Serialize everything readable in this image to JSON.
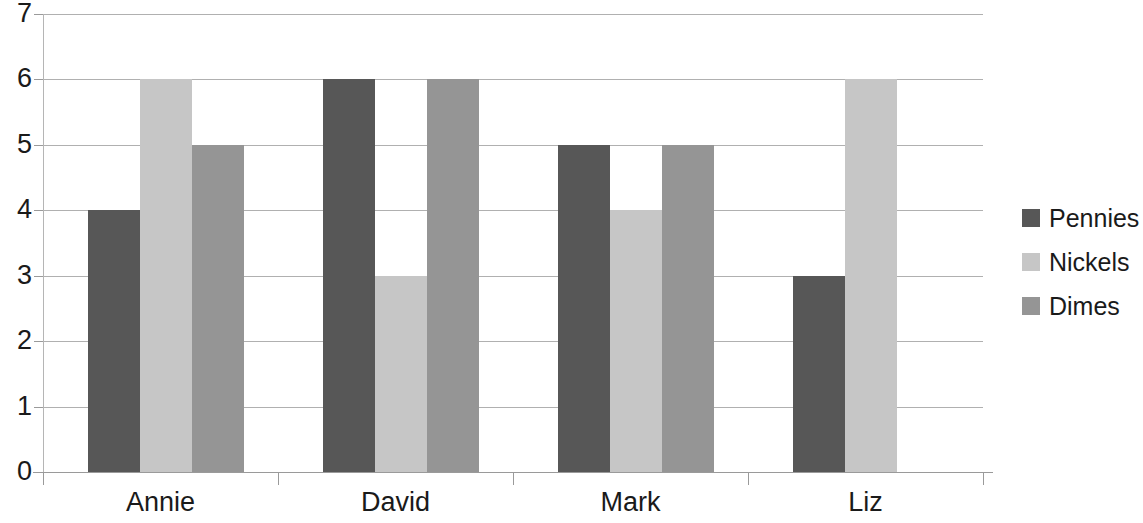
{
  "chart_data": {
    "type": "bar",
    "title": "",
    "subtitle": "",
    "xlabel": "",
    "ylabel": "",
    "categories": [
      "Annie",
      "David",
      "Mark",
      "Liz"
    ],
    "series": [
      {
        "name": "Pennies",
        "color": "#575757",
        "values": [
          4,
          6,
          5,
          3
        ]
      },
      {
        "name": "Nickels",
        "color": "#c6c6c6",
        "values": [
          6,
          3,
          4,
          6
        ]
      },
      {
        "name": "Dimes",
        "color": "#959595",
        "values": [
          5,
          6,
          5,
          0
        ]
      }
    ],
    "ylim": [
      0,
      7
    ],
    "ytick_values": [
      0,
      1,
      2,
      3,
      4,
      5,
      6,
      7
    ],
    "ytick_labels": [
      "0",
      "1",
      "2",
      "3",
      "4",
      "5",
      "6",
      "7"
    ],
    "grid": true,
    "grid_axis": "y",
    "legend_position": "right",
    "annotations": [],
    "background": "#ffffff"
  },
  "legend": {
    "items": [
      {
        "label": "Pennies",
        "swatch": "pennies-swatch"
      },
      {
        "label": "Nickels",
        "swatch": "nickels-swatch"
      },
      {
        "label": "Dimes",
        "swatch": "dimes-swatch"
      }
    ]
  }
}
